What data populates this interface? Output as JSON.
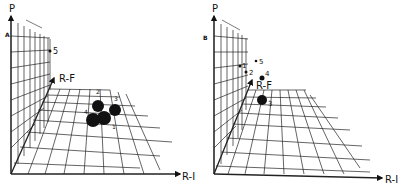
{
  "panels": [
    {
      "id": "A",
      "panel_label": "A",
      "axes": {
        "vertical": "P",
        "depth": "R-F",
        "horizontal": "R-I"
      },
      "points": [
        {
          "label": "1",
          "size": "large"
        },
        {
          "label": "2",
          "size": "large"
        },
        {
          "label": "3",
          "size": "large"
        },
        {
          "label": "4",
          "size": "large"
        },
        {
          "label": "5",
          "size": "small"
        }
      ]
    },
    {
      "id": "B",
      "panel_label": "B",
      "axes": {
        "vertical": "P",
        "depth": "R-F",
        "horizontal": "R-I"
      },
      "points": [
        {
          "label": "1",
          "size": "small"
        },
        {
          "label": "2",
          "size": "small"
        },
        {
          "label": "3",
          "size": "large"
        },
        {
          "label": "4",
          "size": "medium"
        },
        {
          "label": "5",
          "size": "small"
        }
      ]
    }
  ],
  "colors": {
    "ink": "#111111",
    "background": "#ffffff"
  }
}
